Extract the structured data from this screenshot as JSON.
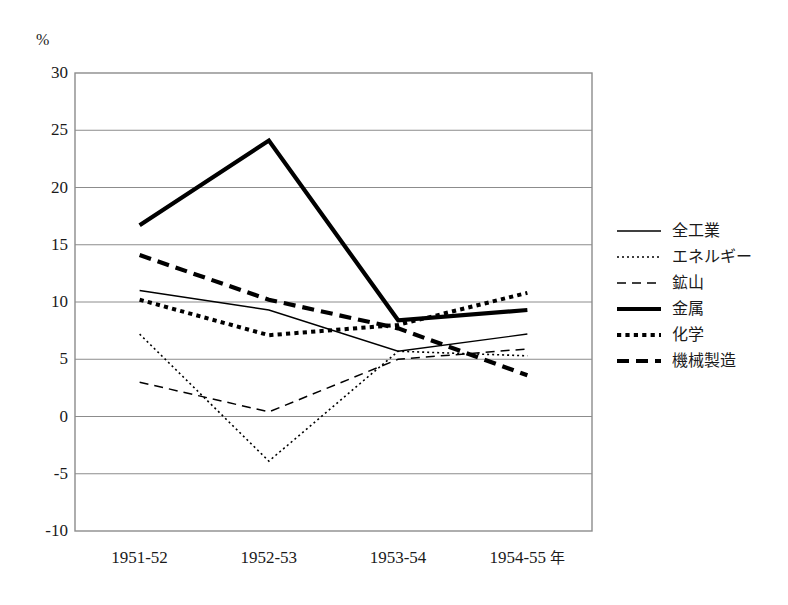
{
  "chart_data": {
    "type": "line",
    "title": "",
    "xlabel": "年",
    "ylabel": "%",
    "ylim": [
      -10,
      30
    ],
    "ytick_step": 5,
    "yticks": [
      "30",
      "25",
      "20",
      "15",
      "10",
      "5",
      "0",
      "-5",
      "-10"
    ],
    "grid": true,
    "grid_axis": "y",
    "legend_position": "right",
    "categories": [
      "1951-52",
      "1952-53",
      "1953-54",
      "1954-55"
    ],
    "x_axis_unit": "年",
    "series": [
      {
        "name": "全工業",
        "style": "solid-thin",
        "values": [
          11.0,
          9.3,
          5.7,
          7.2
        ]
      },
      {
        "name": "エネルギー",
        "style": "dotted-thin",
        "values": [
          7.2,
          -3.9,
          5.7,
          5.3
        ]
      },
      {
        "name": "鉱山",
        "style": "dashed-thin",
        "values": [
          3.0,
          0.4,
          5.0,
          5.9
        ]
      },
      {
        "name": "金属",
        "style": "solid-thick",
        "values": [
          16.7,
          24.1,
          8.4,
          9.3
        ]
      },
      {
        "name": "化学",
        "style": "dotted-thick",
        "values": [
          10.2,
          7.1,
          8.0,
          10.8
        ]
      },
      {
        "name": "機械製造",
        "style": "dashed-thick",
        "values": [
          14.1,
          10.2,
          7.7,
          3.6
        ]
      }
    ],
    "colors": {
      "line": "#000000",
      "grid": "#8c8c8c",
      "frame": "#8c8c8c",
      "background": "#ffffff"
    }
  }
}
